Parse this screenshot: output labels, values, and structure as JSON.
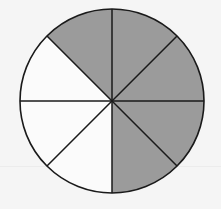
{
  "diagram": {
    "type": "fraction-circle",
    "total_sectors": 8,
    "shaded_count": 5,
    "fraction_label": "5/8",
    "center": [
      112,
      101
    ],
    "radius": 92,
    "colors": {
      "shaded": "#9b9b9b",
      "unshaded": "#fbfbfb",
      "stroke": "#1a1a1a",
      "background": "#f5f5f5"
    },
    "sectors": [
      {
        "index": 0,
        "from_deg": -90,
        "to_deg": -45,
        "position": "north-to-northeast",
        "shaded": true
      },
      {
        "index": 1,
        "from_deg": -45,
        "to_deg": 0,
        "position": "northeast-to-east",
        "shaded": true
      },
      {
        "index": 2,
        "from_deg": 0,
        "to_deg": 45,
        "position": "east-to-southeast",
        "shaded": true
      },
      {
        "index": 3,
        "from_deg": 45,
        "to_deg": 90,
        "position": "southeast-to-south",
        "shaded": true
      },
      {
        "index": 4,
        "from_deg": 90,
        "to_deg": 135,
        "position": "south-to-southwest",
        "shaded": false
      },
      {
        "index": 5,
        "from_deg": 135,
        "to_deg": 180,
        "position": "southwest-to-west",
        "shaded": false
      },
      {
        "index": 6,
        "from_deg": 180,
        "to_deg": 225,
        "position": "west-to-northwest",
        "shaded": false
      },
      {
        "index": 7,
        "from_deg": 225,
        "to_deg": 270,
        "position": "northwest-to-north",
        "shaded": true
      }
    ]
  }
}
